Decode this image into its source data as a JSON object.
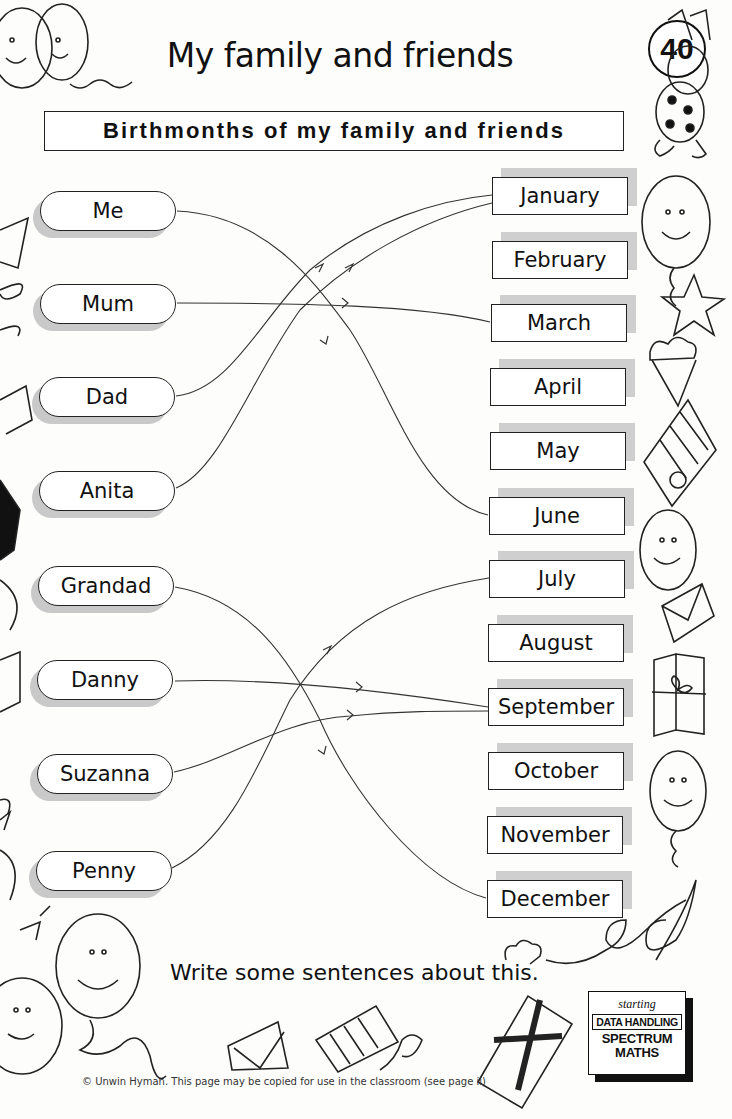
{
  "header": {
    "title": "My family and friends",
    "page_number": "40",
    "subtitle": "Birthmonths of my family and friends"
  },
  "people": [
    {
      "name": "Me",
      "month": "June"
    },
    {
      "name": "Mum",
      "month": "March"
    },
    {
      "name": "Dad",
      "month": "January"
    },
    {
      "name": "Anita",
      "month": "January"
    },
    {
      "name": "Grandad",
      "month": "December"
    },
    {
      "name": "Danny",
      "month": "September"
    },
    {
      "name": "Suzanna",
      "month": "September"
    },
    {
      "name": "Penny",
      "month": "July"
    }
  ],
  "months": [
    "January",
    "February",
    "March",
    "April",
    "May",
    "June",
    "July",
    "August",
    "September",
    "October",
    "November",
    "December"
  ],
  "prompt": "Write some sentences about this.",
  "logo": {
    "line1": "starting",
    "line2": "DATA HANDLING",
    "line3": "SPECTRUM",
    "line4": "MATHS"
  },
  "footer": {
    "copyright": "© Unwin Hyman. This page may be copied for use in the classroom (see page ii)"
  },
  "decorations": [
    "balloon-icon",
    "rabbit-icon",
    "envelope-icon",
    "star-icon",
    "ice-cream-icon",
    "gift-icon",
    "cracker-icon",
    "ribbon-icon"
  ],
  "colors": {
    "ink": "#111111",
    "shadow": "#cccccc",
    "paper": "#fdfdfc"
  }
}
